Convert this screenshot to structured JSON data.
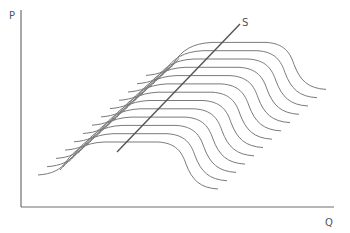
{
  "diagram": {
    "y_axis_label": "P",
    "x_axis_label": "Q",
    "line_label": "S",
    "colors": {
      "axis": "#6e6e6e",
      "curves": "#7a7a7a",
      "line": "#555555",
      "background": "#ffffff"
    }
  },
  "chart_data": {
    "type": "line",
    "title": "",
    "xlabel": "Q",
    "ylabel": "P",
    "curve_count": 13,
    "curve_shift_px": {
      "dx": 9,
      "dy": -8.3
    },
    "base_curve_px": [
      [
        38,
        175
      ],
      [
        62,
        168
      ],
      [
        80,
        150
      ],
      [
        100,
        143
      ],
      [
        160,
        143
      ],
      [
        178,
        150
      ],
      [
        188,
        168
      ],
      [
        200,
        183
      ],
      [
        218,
        190
      ]
    ],
    "s_line_px": {
      "from": [
        117,
        152
      ],
      "to": [
        240,
        24
      ]
    },
    "grid": false,
    "legend": false
  }
}
